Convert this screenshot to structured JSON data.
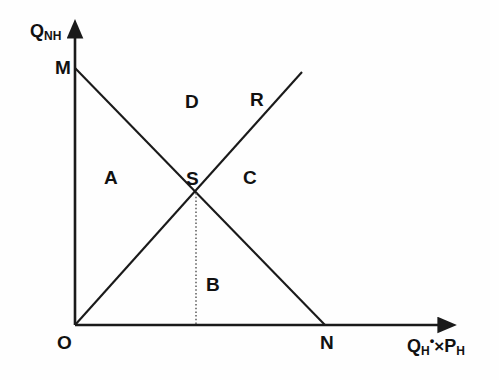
{
  "figure": {
    "type": "line-diagram",
    "background_color": "#fefefe",
    "stroke_color": "#1a1a1a",
    "width": 499,
    "height": 380
  },
  "axes": {
    "y_axis": {
      "name": "vertical-axis",
      "label_q": "Q",
      "label_sub": "NH",
      "origin": [
        75,
        325
      ],
      "tip": [
        75,
        30
      ]
    },
    "x_axis": {
      "name": "horizontal-axis",
      "label_q": "Q",
      "label_q_sub": "H",
      "label_star": "•",
      "label_times": "×",
      "label_p": "P",
      "label_p_sub": "H",
      "origin": [
        75,
        325
      ],
      "tip": [
        447,
        325
      ]
    }
  },
  "points": [
    {
      "id": "O",
      "label": "O",
      "x": 75,
      "y": 325,
      "desc": "origin"
    },
    {
      "id": "M",
      "label": "M",
      "x": 75,
      "y": 68,
      "desc": "y-intercept of demand line"
    },
    {
      "id": "N",
      "label": "N",
      "x": 325,
      "y": 325,
      "desc": "x-intercept of demand line"
    },
    {
      "id": "S",
      "label": "S",
      "x": 196,
      "y": 193,
      "desc": "equilibrium intersection"
    },
    {
      "id": "R",
      "label": "R",
      "x": 302,
      "y": 72,
      "desc": "upper end of supply ray"
    }
  ],
  "lines": [
    {
      "id": "MN",
      "name": "demand-line-mn",
      "from": [
        75,
        68
      ],
      "to": [
        325,
        325
      ],
      "style": "solid"
    },
    {
      "id": "OR",
      "name": "supply-ray-or",
      "from": [
        75,
        325
      ],
      "to": [
        302,
        72
      ],
      "style": "solid"
    },
    {
      "id": "SX",
      "name": "projection-line-s",
      "from": [
        196,
        193
      ],
      "to": [
        196,
        325
      ],
      "style": "dotted"
    }
  ],
  "regions": [
    {
      "id": "A",
      "label": "A",
      "x": 111,
      "y": 178
    },
    {
      "id": "B",
      "label": "B",
      "x": 213,
      "y": 285
    },
    {
      "id": "C",
      "label": "C",
      "x": 250,
      "y": 178
    },
    {
      "id": "D",
      "label": "D",
      "x": 192,
      "y": 102
    }
  ],
  "point_labels": {
    "M": {
      "label": "M",
      "left": 55,
      "top": 58
    },
    "O": {
      "label": "O",
      "left": 57,
      "top": 333
    },
    "N": {
      "label": "N",
      "left": 322,
      "top": 333
    },
    "S": {
      "label": "S",
      "left": 186,
      "top": 169
    },
    "R": {
      "label": "R",
      "left": 250,
      "top": 90
    }
  }
}
